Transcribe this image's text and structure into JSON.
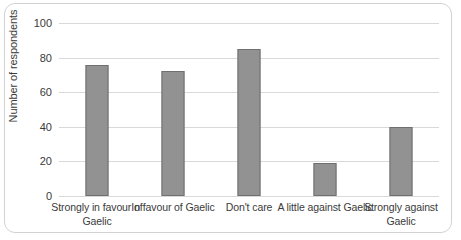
{
  "chart_data": {
    "type": "bar",
    "title": "",
    "xlabel": "",
    "ylabel": "Number of respondents",
    "categories": [
      "Strongly in favour of Gaelic",
      "In favour of Gaelic",
      "Don't care",
      "A little against Gaelic",
      "Strongly against Gaelic"
    ],
    "values": [
      76,
      72,
      85,
      19,
      40
    ],
    "ylim": [
      0,
      100
    ],
    "yticks": [
      0,
      20,
      40,
      60,
      80,
      100
    ],
    "ytick_labels": [
      "0",
      "20",
      "40",
      "60",
      "80",
      "100"
    ],
    "grid": true,
    "legend": false,
    "colors": {
      "bar_fill": "#929292",
      "bar_border": "#6f6f6f",
      "gridline": "#d9d9d9",
      "text": "#3a3a3a",
      "frame_border": "#d2d2d2",
      "background": "#ffffff"
    }
  }
}
